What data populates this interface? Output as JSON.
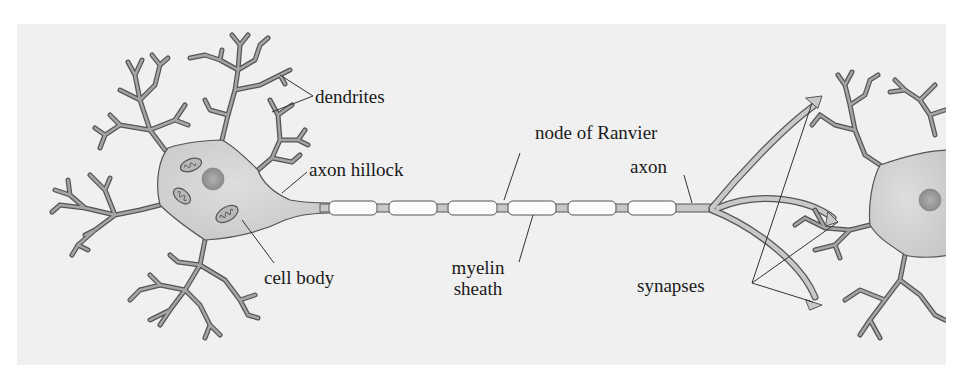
{
  "diagram": {
    "colors": {
      "background": "#f0f0f0",
      "page": "#ffffff",
      "cell_fill": "#d3d3d3",
      "cell_fill_dark": "#c2c2c2",
      "outline": "#555555",
      "dendrite": "#9a9a9a",
      "nucleus": "#9e9e9e",
      "myelin": "#fbfbfb",
      "leader_line": "#333333",
      "text": "#1a1a1a"
    },
    "labels": {
      "dendrites": "dendrites",
      "axon_hillock": "axon hillock",
      "cell_body": "cell body",
      "node_of_ranvier": "node of Ranvier",
      "myelin_sheath_line1": "myelin",
      "myelin_sheath_line2": "sheath",
      "axon": "axon",
      "synapses": "synapses"
    },
    "myelin_segments": [
      {
        "x": 329,
        "w": 48
      },
      {
        "x": 389,
        "w": 48
      },
      {
        "x": 448,
        "w": 49
      },
      {
        "x": 508,
        "w": 48
      },
      {
        "x": 568,
        "w": 48
      },
      {
        "x": 628,
        "w": 48
      }
    ],
    "components": [
      "dendrites",
      "cell body",
      "nucleus",
      "mitochondria",
      "axon hillock",
      "axon",
      "myelin sheath",
      "node of Ranvier",
      "axon terminals",
      "synapses",
      "postsynaptic neuron"
    ]
  }
}
